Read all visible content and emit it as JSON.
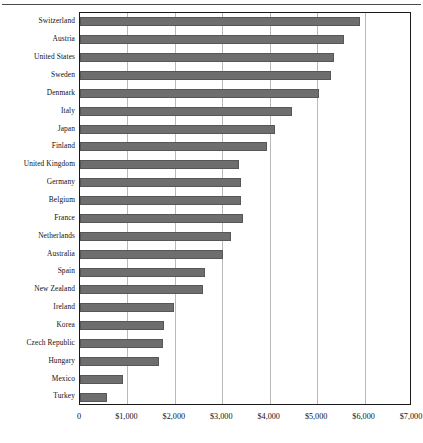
{
  "chart_data": {
    "type": "bar",
    "orientation": "horizontal",
    "title": "",
    "subtitle": "",
    "xlabel": "",
    "ylabel": "",
    "xlim": [
      0,
      7000
    ],
    "xticks": [
      0,
      1000,
      2000,
      3000,
      4000,
      5000,
      6000,
      7000
    ],
    "xtick_labels": [
      "0",
      "$1,000",
      "$2,000",
      "$3,000",
      "$4,000",
      "$5,000",
      "$6,000",
      "$7,000"
    ],
    "grid": "vertical",
    "legend": "none",
    "bar_color": "#6e6e6e",
    "bar_edge_color": "#575757",
    "frame_color": "#1a1a1a",
    "gridline_color": "#b9b9b9",
    "categories": [
      "Switzerland",
      "Austria",
      "United States",
      "Sweden",
      "Denmark",
      "Italy",
      "Japan",
      "Finland",
      "United Kingdom",
      "Germany",
      "Belgium",
      "France",
      "Netherlands",
      "Australia",
      "Spain",
      "New Zealand",
      "Ireland",
      "Korea",
      "Czech Republic",
      "Hungary",
      "Mexico",
      "Turkey"
    ],
    "values": [
      5910,
      5570,
      5360,
      5290,
      5040,
      4470,
      4110,
      3940,
      3350,
      3390,
      3390,
      3440,
      3190,
      3020,
      2640,
      2590,
      1990,
      1770,
      1750,
      1670,
      910,
      570
    ]
  }
}
